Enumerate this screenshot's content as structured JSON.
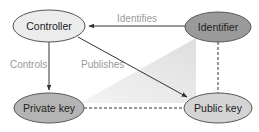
{
  "diagram": {
    "nodes": [
      {
        "id": "controller",
        "label": "Controller",
        "fill": "#ececec"
      },
      {
        "id": "identifier",
        "label": "Identifier",
        "fill": "#9a9a9a"
      },
      {
        "id": "private_key",
        "label": "Private key",
        "fill": "#b4b4b4"
      },
      {
        "id": "public_key",
        "label": "Public key",
        "fill": "#d4d4d4"
      }
    ],
    "edges": [
      {
        "from": "identifier",
        "to": "controller",
        "label": "Identifies",
        "style": "solid-arrow"
      },
      {
        "from": "controller",
        "to": "private_key",
        "label": "Controls",
        "style": "solid-arrow"
      },
      {
        "from": "controller",
        "to": "public_key",
        "label": "Publishes",
        "style": "solid-arrow"
      },
      {
        "from": "private_key",
        "to": "public_key",
        "label": "",
        "style": "dashed"
      },
      {
        "from": "identifier",
        "to": "public_key",
        "label": "",
        "style": "dashed"
      }
    ],
    "labels": {
      "controller": "Controller",
      "identifier": "Identifier",
      "private_key": "Private key",
      "public_key": "Public key",
      "identifies": "Identifies",
      "controls": "Controls",
      "publishes": "Publishes"
    },
    "colors": {
      "edge": "#333333",
      "triangle": "#e4e4e4",
      "node_stroke": "#555555"
    }
  }
}
